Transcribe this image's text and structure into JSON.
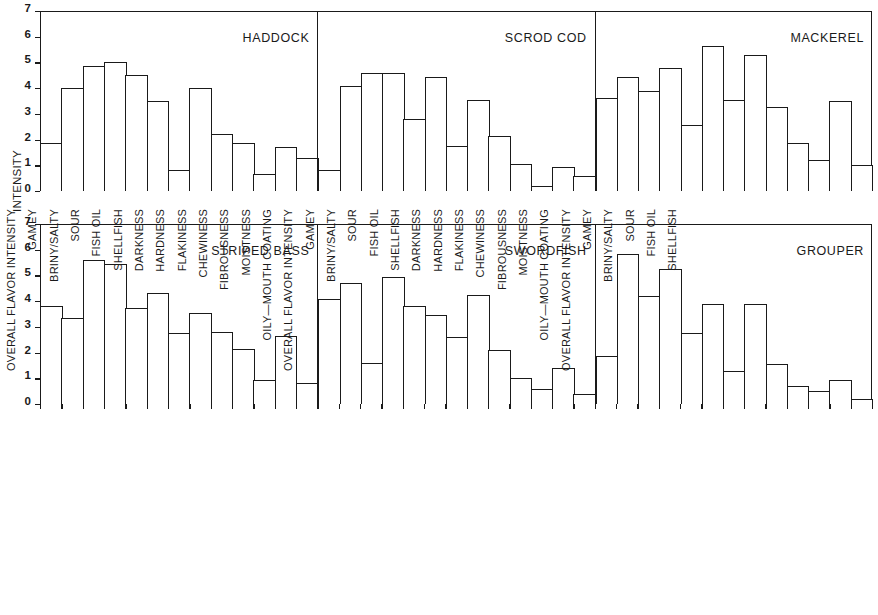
{
  "chart_data": {
    "type": "bar",
    "title": "",
    "xlabel": "",
    "ylabel": "INTENSITY",
    "ylim": [
      0,
      7
    ],
    "yticks": [
      0,
      1,
      2,
      3,
      4,
      5,
      6,
      7
    ],
    "grid": false,
    "legend": "none",
    "layout": "2 rows x 3 panels, shared y-axis (0-7), shared x categories",
    "categories": [
      "DARKNESS",
      "HARDNESS",
      "FLAKINESS",
      "CHEWINESS",
      "FIBROUSNESS",
      "MOISTNESS",
      "OILY—MOUTH COATING",
      "OVERALL FLAVOR INTENSITY",
      "GAMEY",
      "BRINY/SALTY",
      "SOUR",
      "FISH OIL",
      "SHELLFISH"
    ],
    "panels": [
      {
        "name": "HADDOCK",
        "row": 0,
        "column": 0,
        "values": [
          1.85,
          4.0,
          4.85,
          5.0,
          4.5,
          3.5,
          0.8,
          4.0,
          2.2,
          1.85,
          0.65,
          1.7,
          1.3
        ]
      },
      {
        "name": "SCROD COD",
        "row": 0,
        "column": 1,
        "values": [
          0.8,
          4.1,
          4.6,
          4.6,
          2.8,
          4.45,
          1.75,
          3.55,
          2.15,
          1.05,
          0.2,
          0.95,
          0.6
        ]
      },
      {
        "name": "MACKEREL",
        "row": 0,
        "column": 2,
        "values": [
          3.6,
          4.45,
          3.9,
          4.8,
          2.55,
          5.65,
          3.55,
          5.3,
          3.25,
          1.85,
          1.2,
          3.5,
          1.0
        ]
      },
      {
        "name": "STRIPED BASS",
        "row": 1,
        "column": 0,
        "values": [
          3.8,
          3.35,
          5.6,
          5.45,
          3.75,
          4.3,
          2.75,
          3.55,
          2.8,
          2.15,
          0.95,
          2.65,
          0.8
        ]
      },
      {
        "name": "SWORDFISH",
        "row": 1,
        "column": 1,
        "values": [
          4.1,
          4.7,
          1.6,
          4.95,
          3.8,
          3.45,
          2.6,
          4.25,
          2.1,
          1.0,
          0.6,
          1.4,
          0.4
        ]
      },
      {
        "name": "GROUPER",
        "row": 1,
        "column": 2,
        "values": [
          1.85,
          5.85,
          4.2,
          5.25,
          2.75,
          3.9,
          1.3,
          3.9,
          1.55,
          0.7,
          0.5,
          0.95,
          0.2
        ]
      }
    ]
  },
  "colors": {
    "ink": "#1a1a1a",
    "background": "#ffffff",
    "bar_fill": "#ffffff"
  }
}
